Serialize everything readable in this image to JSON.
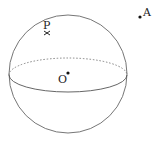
{
  "figure": {
    "type": "sphere-diagram",
    "sphere": {
      "center_label": "O"
    },
    "points": [
      {
        "label": "P",
        "description": "point on sphere surface marked with x"
      },
      {
        "label": "A",
        "description": "point outside the sphere"
      },
      {
        "label": "O",
        "description": "center of sphere"
      }
    ],
    "colors": {
      "stroke": "#555555",
      "point": "#111111",
      "text": "#222222"
    }
  }
}
